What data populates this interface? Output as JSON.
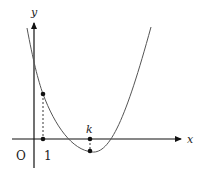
{
  "diagram": {
    "type": "function-graph",
    "axes": {
      "x_label": "x",
      "y_label": "y",
      "origin_label": "O"
    },
    "tick_labels": {
      "one": "1",
      "k": "k"
    },
    "colors": {
      "axis": "#111111",
      "curve": "#555555",
      "points": "#111111",
      "dashed": "#222222"
    }
  }
}
